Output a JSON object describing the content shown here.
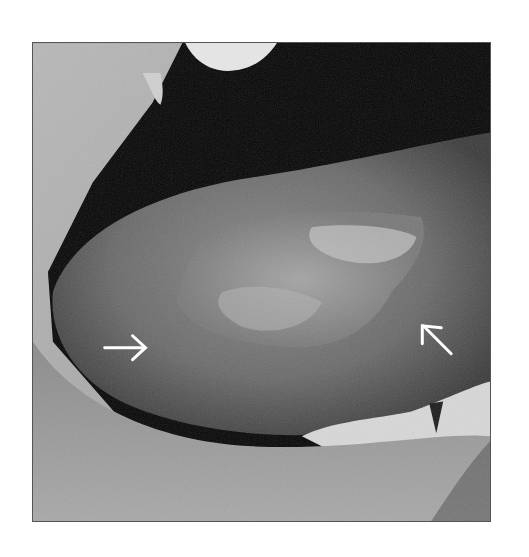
{
  "figure": {
    "type": "clinical-photograph",
    "color_mode": "grayscale",
    "annotations": [
      {
        "id": "arrow-left",
        "direction": "right",
        "color": "#ffffff"
      },
      {
        "id": "arrow-right",
        "direction": "up-left",
        "color": "#ffffff"
      }
    ]
  }
}
